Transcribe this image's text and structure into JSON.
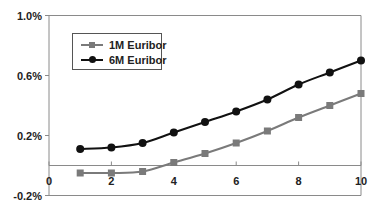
{
  "chart_data": {
    "type": "line",
    "title": "",
    "xlabel": "",
    "ylabel": "",
    "x": [
      1,
      2,
      3,
      4,
      5,
      6,
      7,
      8,
      9,
      10
    ],
    "xlim": [
      0,
      10
    ],
    "ylim": [
      -0.2,
      1.0
    ],
    "x_ticks": [
      "0",
      "2",
      "4",
      "6",
      "8",
      "10"
    ],
    "x_tick_values": [
      0,
      2,
      4,
      6,
      8,
      10
    ],
    "y_ticks": [
      "1.0%",
      "0.6%",
      "0.2%",
      "-0.2%"
    ],
    "y_tick_values": [
      1.0,
      0.6,
      0.2,
      -0.2
    ],
    "grid": false,
    "legend_position": "upper-left (inside)",
    "series": [
      {
        "name": "1M Euribor",
        "color": "#7a7a7a",
        "marker": "square",
        "values": [
          -0.05,
          -0.05,
          -0.04,
          0.02,
          0.08,
          0.15,
          0.23,
          0.32,
          0.4,
          0.48
        ]
      },
      {
        "name": "6M Euribor",
        "color": "#111111",
        "marker": "circle",
        "values": [
          0.11,
          0.12,
          0.15,
          0.22,
          0.29,
          0.36,
          0.44,
          0.54,
          0.62,
          0.7
        ]
      }
    ]
  },
  "legend": {
    "items": [
      {
        "label": "1M Euribor"
      },
      {
        "label": "6M Euribor"
      }
    ]
  },
  "colors": {
    "axis": "#8a8a8a",
    "text": "#222222"
  }
}
